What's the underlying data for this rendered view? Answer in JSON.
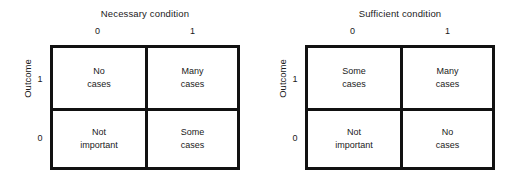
{
  "figure": {
    "panels": [
      {
        "key": "necessary",
        "title": "Necessary condition",
        "column_axis_label": "Necessary condition",
        "column_labels": [
          "0",
          "1"
        ],
        "row_axis_label": "Outcome",
        "row_labels": [
          "1",
          "0"
        ],
        "cells": [
          {
            "row": "1",
            "col": "0",
            "line1": "No",
            "line2": "cases"
          },
          {
            "row": "1",
            "col": "1",
            "line1": "Many",
            "line2": "cases"
          },
          {
            "row": "0",
            "col": "0",
            "line1": "Not",
            "line2": "important"
          },
          {
            "row": "0",
            "col": "1",
            "line1": "Some",
            "line2": "cases"
          }
        ]
      },
      {
        "key": "sufficient",
        "title": "Sufficient condition",
        "column_axis_label": "Sufficient condition",
        "column_labels": [
          "0",
          "1"
        ],
        "row_axis_label": "Outcome",
        "row_labels": [
          "1",
          "0"
        ],
        "cells": [
          {
            "row": "1",
            "col": "0",
            "line1": "Some",
            "line2": "cases"
          },
          {
            "row": "1",
            "col": "1",
            "line1": "Many",
            "line2": "cases"
          },
          {
            "row": "0",
            "col": "0",
            "line1": "Not",
            "line2": "important"
          },
          {
            "row": "0",
            "col": "1",
            "line1": "No",
            "line2": "cases"
          }
        ]
      }
    ],
    "colors": {
      "border": "#111111",
      "text": "#1a1a1a",
      "background": "#ffffff"
    }
  }
}
